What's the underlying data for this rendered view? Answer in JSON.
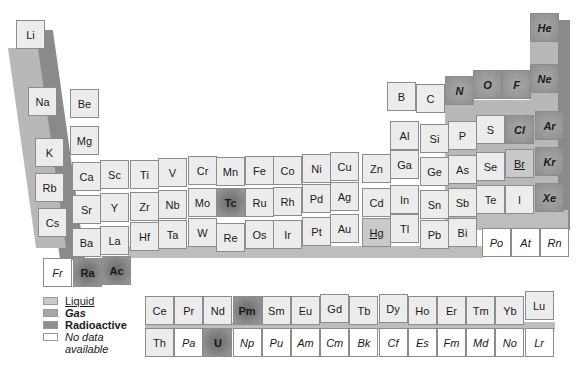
{
  "colors": {
    "solid": "#ececec",
    "liquid": "#c9c9c9",
    "gas": "#a6a6a6",
    "radioactive": "#8e8e8e",
    "no_data": "#ffffff",
    "shadow": "#8a8a8a"
  },
  "legend": [
    {
      "key": "liquid",
      "label": "Liquid"
    },
    {
      "key": "gas",
      "label": "Gas"
    },
    {
      "key": "radio",
      "label": "Radioactive"
    },
    {
      "key": "nodata",
      "label": "No data available"
    }
  ],
  "main_table": [
    {
      "sym": "Li",
      "x": 16,
      "y": 20,
      "type": "solid"
    },
    {
      "sym": "Na",
      "x": 28,
      "y": 87,
      "type": "solid"
    },
    {
      "sym": "Be",
      "x": 70,
      "y": 89,
      "type": "solid"
    },
    {
      "sym": "Mg",
      "x": 70,
      "y": 126,
      "type": "solid"
    },
    {
      "sym": "K",
      "x": 35,
      "y": 138,
      "type": "solid"
    },
    {
      "sym": "Ca",
      "x": 72,
      "y": 162,
      "type": "solid"
    },
    {
      "sym": "Sc",
      "x": 100,
      "y": 160,
      "type": "solid"
    },
    {
      "sym": "Ti",
      "x": 130,
      "y": 160,
      "type": "solid"
    },
    {
      "sym": "V",
      "x": 158,
      "y": 158,
      "type": "solid"
    },
    {
      "sym": "Cr",
      "x": 188,
      "y": 156,
      "type": "solid"
    },
    {
      "sym": "Mn",
      "x": 216,
      "y": 157,
      "type": "solid"
    },
    {
      "sym": "Fe",
      "x": 245,
      "y": 156,
      "type": "solid"
    },
    {
      "sym": "Co",
      "x": 273,
      "y": 156,
      "type": "solid"
    },
    {
      "sym": "Ni",
      "x": 302,
      "y": 154,
      "type": "solid"
    },
    {
      "sym": "Cu",
      "x": 330,
      "y": 152,
      "type": "solid"
    },
    {
      "sym": "Zn",
      "x": 362,
      "y": 154,
      "type": "solid"
    },
    {
      "sym": "Ga",
      "x": 390,
      "y": 150,
      "type": "solid"
    },
    {
      "sym": "Ge",
      "x": 420,
      "y": 157,
      "type": "solid"
    },
    {
      "sym": "As",
      "x": 448,
      "y": 155,
      "type": "solid"
    },
    {
      "sym": "Se",
      "x": 476,
      "y": 152,
      "type": "solid"
    },
    {
      "sym": "Br",
      "x": 505,
      "y": 149,
      "type": "liquid"
    },
    {
      "sym": "Kr",
      "x": 535,
      "y": 147,
      "type": "gas"
    },
    {
      "sym": "Rb",
      "x": 35,
      "y": 173,
      "type": "solid"
    },
    {
      "sym": "Sr",
      "x": 72,
      "y": 195,
      "type": "solid"
    },
    {
      "sym": "Y",
      "x": 100,
      "y": 193,
      "type": "solid"
    },
    {
      "sym": "Zr",
      "x": 130,
      "y": 192,
      "type": "solid"
    },
    {
      "sym": "Nb",
      "x": 158,
      "y": 190,
      "type": "solid"
    },
    {
      "sym": "Mo",
      "x": 188,
      "y": 188,
      "type": "solid"
    },
    {
      "sym": "Tc",
      "x": 216,
      "y": 188,
      "type": "radio"
    },
    {
      "sym": "Ru",
      "x": 245,
      "y": 188,
      "type": "solid"
    },
    {
      "sym": "Rh",
      "x": 273,
      "y": 187,
      "type": "solid"
    },
    {
      "sym": "Pd",
      "x": 302,
      "y": 184,
      "type": "solid"
    },
    {
      "sym": "Ag",
      "x": 330,
      "y": 182,
      "type": "solid"
    },
    {
      "sym": "Cd",
      "x": 362,
      "y": 188,
      "type": "solid"
    },
    {
      "sym": "In",
      "x": 390,
      "y": 185,
      "type": "solid"
    },
    {
      "sym": "Sn",
      "x": 420,
      "y": 190,
      "type": "solid"
    },
    {
      "sym": "Sb",
      "x": 448,
      "y": 188,
      "type": "solid"
    },
    {
      "sym": "Te",
      "x": 476,
      "y": 185,
      "type": "solid"
    },
    {
      "sym": "I",
      "x": 505,
      "y": 185,
      "type": "solid"
    },
    {
      "sym": "Xe",
      "x": 535,
      "y": 183,
      "type": "gas"
    },
    {
      "sym": "Cs",
      "x": 38,
      "y": 208,
      "type": "solid"
    },
    {
      "sym": "Ba",
      "x": 72,
      "y": 228,
      "type": "solid"
    },
    {
      "sym": "La",
      "x": 100,
      "y": 226,
      "type": "solid"
    },
    {
      "sym": "Hf",
      "x": 130,
      "y": 222,
      "type": "solid"
    },
    {
      "sym": "Ta",
      "x": 158,
      "y": 220,
      "type": "solid"
    },
    {
      "sym": "W",
      "x": 188,
      "y": 218,
      "type": "solid"
    },
    {
      "sym": "Re",
      "x": 216,
      "y": 223,
      "type": "solid"
    },
    {
      "sym": "Os",
      "x": 245,
      "y": 220,
      "type": "solid"
    },
    {
      "sym": "Ir",
      "x": 273,
      "y": 220,
      "type": "solid"
    },
    {
      "sym": "Pt",
      "x": 302,
      "y": 217,
      "type": "solid"
    },
    {
      "sym": "Au",
      "x": 330,
      "y": 214,
      "type": "solid"
    },
    {
      "sym": "Hg",
      "x": 362,
      "y": 218,
      "type": "liquid"
    },
    {
      "sym": "Tl",
      "x": 390,
      "y": 214,
      "type": "solid"
    },
    {
      "sym": "Pb",
      "x": 420,
      "y": 220,
      "type": "solid"
    },
    {
      "sym": "Bi",
      "x": 448,
      "y": 218,
      "type": "solid"
    },
    {
      "sym": "Po",
      "x": 482,
      "y": 228,
      "type": "nodata"
    },
    {
      "sym": "At",
      "x": 511,
      "y": 228,
      "type": "nodata"
    },
    {
      "sym": "Rn",
      "x": 540,
      "y": 228,
      "type": "nodata"
    },
    {
      "sym": "Fr",
      "x": 43,
      "y": 258,
      "type": "nodata"
    },
    {
      "sym": "Ra",
      "x": 73,
      "y": 258,
      "type": "radio"
    },
    {
      "sym": "Ac",
      "x": 102,
      "y": 256,
      "type": "radio"
    },
    {
      "sym": "B",
      "x": 387,
      "y": 82,
      "type": "solid"
    },
    {
      "sym": "C",
      "x": 416,
      "y": 84,
      "type": "solid"
    },
    {
      "sym": "N",
      "x": 445,
      "y": 76,
      "type": "gas"
    },
    {
      "sym": "O",
      "x": 473,
      "y": 70,
      "type": "gas"
    },
    {
      "sym": "F",
      "x": 502,
      "y": 70,
      "type": "gas"
    },
    {
      "sym": "Ne",
      "x": 530,
      "y": 64,
      "type": "gas"
    },
    {
      "sym": "He",
      "x": 530,
      "y": 13,
      "type": "gas"
    },
    {
      "sym": "Al",
      "x": 390,
      "y": 121,
      "type": "solid"
    },
    {
      "sym": "Si",
      "x": 420,
      "y": 124,
      "type": "solid"
    },
    {
      "sym": "P",
      "x": 448,
      "y": 121,
      "type": "solid"
    },
    {
      "sym": "S",
      "x": 476,
      "y": 115,
      "type": "solid"
    },
    {
      "sym": "Cl",
      "x": 505,
      "y": 115,
      "type": "gas"
    },
    {
      "sym": "Ar",
      "x": 535,
      "y": 111,
      "type": "gas"
    }
  ],
  "lanthanides": [
    {
      "sym": "Ce",
      "type": "solid"
    },
    {
      "sym": "Pr",
      "type": "solid"
    },
    {
      "sym": "Nd",
      "type": "solid"
    },
    {
      "sym": "Pm",
      "type": "radio"
    },
    {
      "sym": "Sm",
      "type": "solid"
    },
    {
      "sym": "Eu",
      "type": "solid"
    },
    {
      "sym": "Gd",
      "type": "solid"
    },
    {
      "sym": "Tb",
      "type": "solid"
    },
    {
      "sym": "Dy",
      "type": "solid"
    },
    {
      "sym": "Ho",
      "type": "solid"
    },
    {
      "sym": "Er",
      "type": "solid"
    },
    {
      "sym": "Tm",
      "type": "solid"
    },
    {
      "sym": "Yb",
      "type": "solid"
    },
    {
      "sym": "Lu",
      "type": "solid"
    }
  ],
  "actinides": [
    {
      "sym": "Th",
      "type": "solid"
    },
    {
      "sym": "Pa",
      "type": "nodata"
    },
    {
      "sym": "U",
      "type": "radio"
    },
    {
      "sym": "Np",
      "type": "nodata"
    },
    {
      "sym": "Pu",
      "type": "nodata"
    },
    {
      "sym": "Am",
      "type": "nodata"
    },
    {
      "sym": "Cm",
      "type": "nodata"
    },
    {
      "sym": "Bk",
      "type": "nodata"
    },
    {
      "sym": "Cf",
      "type": "nodata"
    },
    {
      "sym": "Es",
      "type": "nodata"
    },
    {
      "sym": "Fm",
      "type": "nodata"
    },
    {
      "sym": "Md",
      "type": "nodata"
    },
    {
      "sym": "No",
      "type": "nodata"
    },
    {
      "sym": "Lr",
      "type": "nodata"
    }
  ]
}
